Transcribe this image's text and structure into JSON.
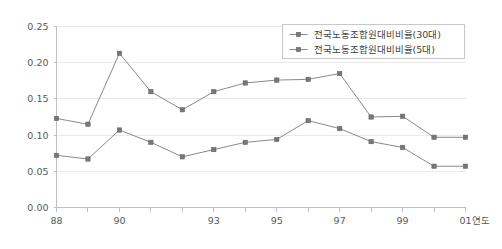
{
  "chart_data": {
    "type": "line",
    "title": "",
    "xlabel": "연도",
    "ylabel": "",
    "x": [
      1988,
      1989,
      1990,
      1991,
      1992,
      1993,
      1994,
      1995,
      1996,
      1997,
      1998,
      1999,
      2000,
      2001
    ],
    "categories": [
      "88",
      "89",
      "90",
      "91",
      "92",
      "93",
      "94",
      "95",
      "96",
      "97",
      "98",
      "99",
      "00",
      "01"
    ],
    "xtick_labels": [
      "88",
      "",
      "90",
      "",
      "",
      "93",
      "",
      "95",
      "",
      "97",
      "",
      "99",
      "",
      "01"
    ],
    "ylim": [
      0.0,
      0.25
    ],
    "ytick_labels": [
      "0.00",
      "0.05",
      "0.10",
      "0.15",
      "0.20",
      "0.25"
    ],
    "ytick_values": [
      0.0,
      0.05,
      0.1,
      0.15,
      0.2,
      0.25
    ],
    "grid": true,
    "legend_position": "top-right",
    "series": [
      {
        "name": "전국노동조합원대비비율(30대)",
        "marker": "square",
        "color": "#77777a",
        "values": [
          0.123,
          0.115,
          0.213,
          0.16,
          0.135,
          0.16,
          0.172,
          0.176,
          0.177,
          0.185,
          0.125,
          0.126,
          0.097,
          0.097
        ]
      },
      {
        "name": "전국노동조합원대비비율(5대)",
        "marker": "square",
        "color": "#77777a",
        "values": [
          0.072,
          0.067,
          0.107,
          0.09,
          0.07,
          0.08,
          0.09,
          0.094,
          0.12,
          0.109,
          0.091,
          0.083,
          0.057,
          0.057
        ]
      }
    ]
  },
  "legend": {
    "entries": [
      {
        "label": "전국노동조합원대비비율(30대)"
      },
      {
        "label": "전국노동조합원대비비율(5대)"
      }
    ]
  },
  "axis": {
    "x_title": "연도"
  }
}
